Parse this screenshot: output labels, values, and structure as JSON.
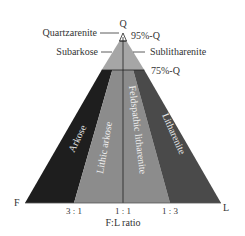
{
  "diagram": {
    "type": "ternary-classification",
    "vertices": {
      "top": "Q",
      "left": "F",
      "right": "L"
    },
    "boundaries": {
      "q95": "95%-Q",
      "q75": "75%-Q"
    },
    "top_fields": {
      "quartzarenite": "Quartzarenite",
      "subarkose": "Subarkose",
      "sublitharenite": "Sublitharenite"
    },
    "lower_fields": [
      {
        "label": "Arkose",
        "color": "#1e1e1e"
      },
      {
        "label": "Lithic arkose",
        "color": "#8c8c8c"
      },
      {
        "label": "Feldspathic litharenite",
        "color": "#8c8c8c"
      },
      {
        "label": "Litharenite",
        "color": "#4a4a4a"
      }
    ],
    "ratios": [
      "3 : 1",
      "1 : 1",
      "1 : 3"
    ],
    "axis_label": "F:L ratio",
    "colors": {
      "top_zone": "#a6a6a6",
      "apex": "#ffffff",
      "line": "#222222"
    }
  }
}
